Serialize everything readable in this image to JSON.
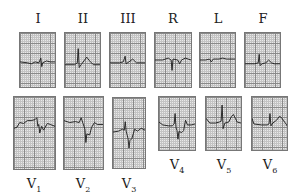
{
  "leads": {
    "I": {
      "label": "I"
    },
    "II": {
      "label": "II"
    },
    "III": {
      "label": "III"
    },
    "R": {
      "label": "R"
    },
    "L": {
      "label": "L"
    },
    "F": {
      "label": "F"
    },
    "V1": {
      "label": "V",
      "sub": "1"
    },
    "V2": {
      "label": "V",
      "sub": "2"
    },
    "V3": {
      "label": "V",
      "sub": "3"
    },
    "V4": {
      "label": "V",
      "sub": "4"
    },
    "V5": {
      "label": "V",
      "sub": "5"
    },
    "V6": {
      "label": "V",
      "sub": "6"
    }
  },
  "colors": {
    "grid_major": "#8a8a8a",
    "grid_minor": "#c4c4c4",
    "trace": "#222222",
    "paper": "#e9e9e9"
  }
}
